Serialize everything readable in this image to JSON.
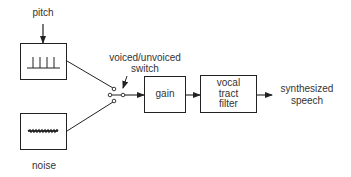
{
  "diagram": {
    "nodes": {
      "pitch": {
        "label": "pitch"
      },
      "pitch_source": {
        "label": "",
        "icon": "impulse-train-icon"
      },
      "noise_source": {
        "label": "",
        "icon": "noise-waveform-icon"
      },
      "noise": {
        "label": "noise"
      },
      "switch": {
        "line1": "voiced/unvoiced",
        "line2": "switch"
      },
      "gain": {
        "label": "gain"
      },
      "vocal_tract": {
        "line1": "vocal",
        "line2": "tract",
        "line3": "filter"
      },
      "output": {
        "line1": "synthesized",
        "line2": "speech"
      }
    },
    "edges": [
      {
        "from": "pitch",
        "to": "pitch_source"
      },
      {
        "from": "pitch_source",
        "to": "switch"
      },
      {
        "from": "noise_source",
        "to": "switch"
      },
      {
        "from": "switch",
        "to": "gain"
      },
      {
        "from": "gain",
        "to": "vocal_tract"
      },
      {
        "from": "vocal_tract",
        "to": "output"
      }
    ],
    "colors": {
      "stroke": "#222222",
      "text": "#333333",
      "background": "#ffffff"
    }
  }
}
